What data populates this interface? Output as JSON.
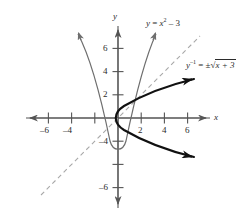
{
  "figure": {
    "type": "function-and-inverse-graph",
    "axes": {
      "x_label": "x",
      "y_label": "y",
      "x_ticks": [
        -6,
        -4,
        -2,
        2,
        4,
        6
      ],
      "x_tick_labels": [
        "–6",
        "–4",
        "",
        "2",
        "4",
        "6"
      ],
      "y_ticks": [
        -6,
        -4,
        -2,
        2,
        4,
        6
      ],
      "y_tick_labels": [
        "–6",
        "–4",
        "",
        "2",
        "4",
        "6"
      ],
      "xlim": [
        -8,
        8
      ],
      "ylim": [
        -8,
        8
      ],
      "origin_px": [
        118,
        118
      ],
      "unit_px": 11.6,
      "grid": false
    },
    "labels": {
      "function": {
        "text": "y = x² – 3",
        "lhs": "y",
        "eq": " = ",
        "base": "x",
        "exponent": "2",
        "rest": " – 3",
        "x_px": 146,
        "y_px": 19
      },
      "inverse": {
        "text": "y⁻¹ = ± √(x + 3)",
        "lhs": "y",
        "exponent": "–1",
        "eq": " = ",
        "pm": "±",
        "radical": "√",
        "radicand": "x + 3",
        "x_px": 186,
        "y_px": 61
      }
    },
    "curves": [
      {
        "name": "function",
        "equation": "y = x² – 3",
        "style": "thin",
        "color": "#6e6e6e",
        "vertex": [
          0,
          -3
        ],
        "arrows": [
          "both-ends-up"
        ]
      },
      {
        "name": "inverse",
        "equation": "x = y² – 3",
        "style": "bold",
        "color": "#1a1a1a",
        "vertex": [
          -3,
          0
        ],
        "arrows": [
          "both-ends-right"
        ]
      },
      {
        "name": "line-of-symmetry",
        "equation": "y = x",
        "style": "dashed",
        "color": "#9a9a9a",
        "arrows": []
      }
    ]
  }
}
